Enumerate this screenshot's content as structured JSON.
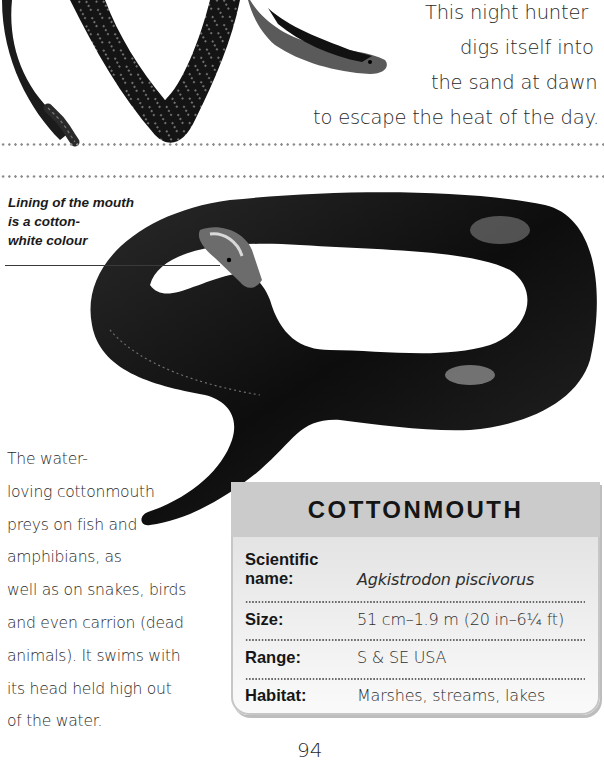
{
  "top_section": {
    "intro_lines": [
      "This night hunter",
      "digs itself into",
      "the sand at dawn",
      "to escape the heat of the day."
    ],
    "illustration": "sidewinder-rattlesnake-illustration"
  },
  "cottonmouth_section": {
    "illustration": "cottonmouth-snake-illustration",
    "caption_lines": [
      "Lining of the mouth",
      "is a cotton-",
      "white colour"
    ],
    "body_lines": [
      "The water-",
      "loving cottonmouth",
      "preys on fish and",
      "amphibians, as",
      "well as on snakes, birds",
      "and even carrion (dead",
      "animals). It swims with",
      "its head held high out",
      "of the water."
    ]
  },
  "fact_box": {
    "title": "COTTONMOUTH",
    "rows": [
      {
        "label_line1": "Scientific",
        "label_line2": "name:",
        "value": "Agkistrodon piscivorus"
      },
      {
        "label": "Size:",
        "value": "51 cm–1.9 m (20 in–6¼ ft)"
      },
      {
        "label": "Range:",
        "value": "S & SE USA"
      },
      {
        "label": "Habitat:",
        "value": "Marshes, streams, lakes"
      }
    ]
  },
  "page_number": "94"
}
